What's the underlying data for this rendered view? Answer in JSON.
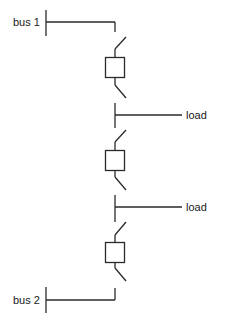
{
  "diagram": {
    "type": "single-line electrical schematic",
    "stroke_color": "#2a2a2a",
    "labels": {
      "bus1": "bus 1",
      "bus2": "bus 2",
      "load1": "load",
      "load2": "load"
    },
    "components": [
      {
        "id": "breaker-1",
        "kind": "circuit-breaker",
        "between": [
          "bus 1",
          "load"
        ]
      },
      {
        "id": "breaker-2",
        "kind": "circuit-breaker",
        "between": [
          "load",
          "load"
        ]
      },
      {
        "id": "breaker-3",
        "kind": "circuit-breaker",
        "between": [
          "load",
          "bus 2"
        ]
      }
    ]
  }
}
